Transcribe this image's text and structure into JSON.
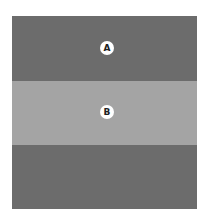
{
  "diagram": {
    "type": "simultaneous-contrast-illustration",
    "regions": [
      {
        "id": "outer",
        "color": "#6c6c6c"
      },
      {
        "id": "band",
        "color": "#a4a4a4"
      }
    ],
    "labels": {
      "a": "A",
      "b": "B"
    }
  }
}
